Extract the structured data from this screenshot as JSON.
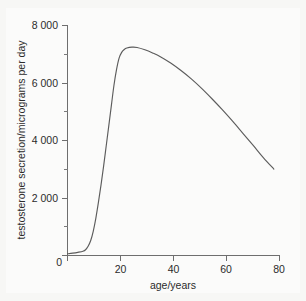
{
  "chart_data": {
    "type": "line",
    "title": "",
    "xlabel": "age/years",
    "ylabel": "testosterone secretion/micrograms per day",
    "xlim": [
      0,
      82
    ],
    "ylim": [
      0,
      8000
    ],
    "grid": false,
    "legend": false,
    "legend_position": "none",
    "x_ticks": [
      0,
      20,
      40,
      60,
      80
    ],
    "x_tick_labels": [
      "0",
      "20",
      "40",
      "60",
      "80"
    ],
    "x_minor_ticks": [
      10,
      30,
      50,
      70
    ],
    "y_ticks": [
      0,
      2000,
      4000,
      6000,
      8000
    ],
    "y_tick_labels": [
      "0",
      "2 000",
      "4 000",
      "6 000",
      "8 000"
    ],
    "y_minor_ticks": [
      1000,
      3000,
      5000,
      7000
    ],
    "line_color": "#5c5c5c",
    "background_color": "#f7f7f5",
    "series": [
      {
        "name": "testosterone secretion",
        "x": [
          0,
          2,
          4,
          6,
          7,
          8,
          9,
          10,
          11,
          12,
          13,
          14,
          15,
          16,
          17,
          18,
          19,
          20,
          21,
          22,
          23,
          25,
          27,
          30,
          33,
          36,
          40,
          44,
          48,
          52,
          56,
          60,
          64,
          68,
          72,
          76,
          80
        ],
        "values": [
          60,
          80,
          110,
          150,
          200,
          320,
          520,
          850,
          1300,
          1850,
          2450,
          3100,
          3800,
          4500,
          5200,
          5900,
          6450,
          6850,
          7050,
          7150,
          7200,
          7230,
          7220,
          7140,
          7030,
          6900,
          6680,
          6420,
          6130,
          5800,
          5440,
          5060,
          4660,
          4240,
          3820,
          3390,
          3000
        ]
      }
    ]
  },
  "axis_labels": {
    "x_title": "age/years",
    "y_title": "testosterone secretion/micrograms per day"
  }
}
